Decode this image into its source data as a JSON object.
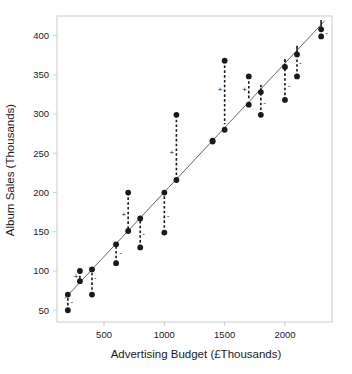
{
  "chart_data": {
    "type": "scatter",
    "title": "",
    "xlabel": "Advertising Budget (£Thousands)",
    "ylabel": "Album Sales (Thousands)",
    "xlim": [
      110,
      2390
    ],
    "ylim": [
      35,
      425
    ],
    "xticks": [
      500,
      1000,
      1500,
      2000
    ],
    "yticks": [
      50,
      100,
      150,
      200,
      250,
      300,
      350,
      400
    ],
    "grid": false,
    "legend": null,
    "points": [
      {
        "x": 200,
        "y": 50,
        "fit": 69,
        "residual": -19,
        "sign": "-"
      },
      {
        "x": 200,
        "y": 70,
        "fit": 69,
        "residual": 1,
        "sign": ""
      },
      {
        "x": 300,
        "y": 87,
        "fit": 86,
        "residual": 1,
        "sign": ""
      },
      {
        "x": 300,
        "y": 100,
        "fit": 86,
        "residual": 14,
        "sign": "+"
      },
      {
        "x": 400,
        "y": 102,
        "fit": 103,
        "residual": -1,
        "sign": ""
      },
      {
        "x": 400,
        "y": 70,
        "fit": 103,
        "residual": -33,
        "sign": "-"
      },
      {
        "x": 600,
        "y": 134,
        "fit": 136,
        "residual": -2,
        "sign": ""
      },
      {
        "x": 600,
        "y": 110,
        "fit": 136,
        "residual": -26,
        "sign": "-"
      },
      {
        "x": 700,
        "y": 151,
        "fit": 153,
        "residual": -2,
        "sign": ""
      },
      {
        "x": 700,
        "y": 200,
        "fit": 153,
        "residual": 47,
        "sign": "+"
      },
      {
        "x": 800,
        "y": 167,
        "fit": 170,
        "residual": -3,
        "sign": ""
      },
      {
        "x": 800,
        "y": 130,
        "fit": 170,
        "residual": -40,
        "sign": "-"
      },
      {
        "x": 1000,
        "y": 200,
        "fit": 203,
        "residual": -3,
        "sign": ""
      },
      {
        "x": 1000,
        "y": 149,
        "fit": 203,
        "residual": -54,
        "sign": "-"
      },
      {
        "x": 1100,
        "y": 216,
        "fit": 220,
        "residual": -4,
        "sign": ""
      },
      {
        "x": 1100,
        "y": 299,
        "fit": 220,
        "residual": 79,
        "sign": "+"
      },
      {
        "x": 1400,
        "y": 266,
        "fit": 270,
        "residual": -4,
        "sign": ""
      },
      {
        "x": 1400,
        "y": 265,
        "fit": 270,
        "residual": -5,
        "sign": ""
      },
      {
        "x": 1500,
        "y": 280,
        "fit": 287,
        "residual": -7,
        "sign": ""
      },
      {
        "x": 1500,
        "y": 368,
        "fit": 287,
        "residual": 81,
        "sign": "+"
      },
      {
        "x": 1700,
        "y": 312,
        "fit": 320,
        "residual": -8,
        "sign": ""
      },
      {
        "x": 1700,
        "y": 348,
        "fit": 320,
        "residual": 28,
        "sign": "+"
      },
      {
        "x": 1800,
        "y": 328,
        "fit": 337,
        "residual": -9,
        "sign": ""
      },
      {
        "x": 1800,
        "y": 299,
        "fit": 337,
        "residual": -38,
        "sign": "-"
      },
      {
        "x": 2000,
        "y": 360,
        "fit": 370,
        "residual": -10,
        "sign": ""
      },
      {
        "x": 2000,
        "y": 318,
        "fit": 370,
        "residual": -52,
        "sign": "-"
      },
      {
        "x": 2100,
        "y": 376,
        "fit": 387,
        "residual": -11,
        "sign": ""
      },
      {
        "x": 2100,
        "y": 348,
        "fit": 387,
        "residual": -39,
        "sign": "-"
      },
      {
        "x": 2300,
        "y": 408,
        "fit": 420,
        "residual": -12,
        "sign": ""
      },
      {
        "x": 2300,
        "y": 399,
        "fit": 420,
        "residual": -21,
        "sign": "-"
      }
    ],
    "residual_markers": [
      {
        "x": 232,
        "y": 62,
        "sign": "-"
      },
      {
        "x": 268,
        "y": 93,
        "sign": "+"
      },
      {
        "x": 425,
        "y": 92,
        "sign": "-"
      },
      {
        "x": 638,
        "y": 124,
        "sign": "-"
      },
      {
        "x": 665,
        "y": 173,
        "sign": "+"
      },
      {
        "x": 828,
        "y": 148,
        "sign": "-"
      },
      {
        "x": 1032,
        "y": 171,
        "sign": "-"
      },
      {
        "x": 1062,
        "y": 252,
        "sign": "+"
      },
      {
        "x": 1462,
        "y": 332,
        "sign": "+"
      },
      {
        "x": 1665,
        "y": 332,
        "sign": "+"
      },
      {
        "x": 1832,
        "y": 315,
        "sign": "-"
      },
      {
        "x": 2035,
        "y": 337,
        "sign": "-"
      },
      {
        "x": 2128,
        "y": 366,
        "sign": "-"
      },
      {
        "x": 2345,
        "y": 404,
        "sign": "-"
      }
    ],
    "regression_line": {
      "x1": 175,
      "y1": 65,
      "x2": 2330,
      "y2": 419,
      "slope": 0.1643,
      "intercept": 36.3
    }
  },
  "colors": {
    "point": "#1a1a1a",
    "line": "#555555",
    "residual": "#1a1a1a",
    "axis": "#cccccc",
    "text": "#1a1a1a",
    "background": "#ffffff"
  }
}
